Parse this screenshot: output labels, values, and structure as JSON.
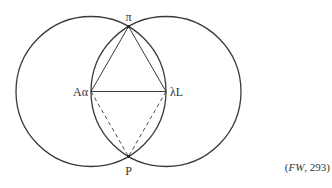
{
  "diagram": {
    "labels": {
      "top": "π",
      "left": "Aα",
      "right": "λL",
      "bottom": "P"
    },
    "caption_prefix": "(",
    "caption_source": "FW",
    "caption_suffix": ", 293)",
    "colors": {
      "stroke": "#3a3a3a",
      "background": "#ffffff"
    }
  }
}
